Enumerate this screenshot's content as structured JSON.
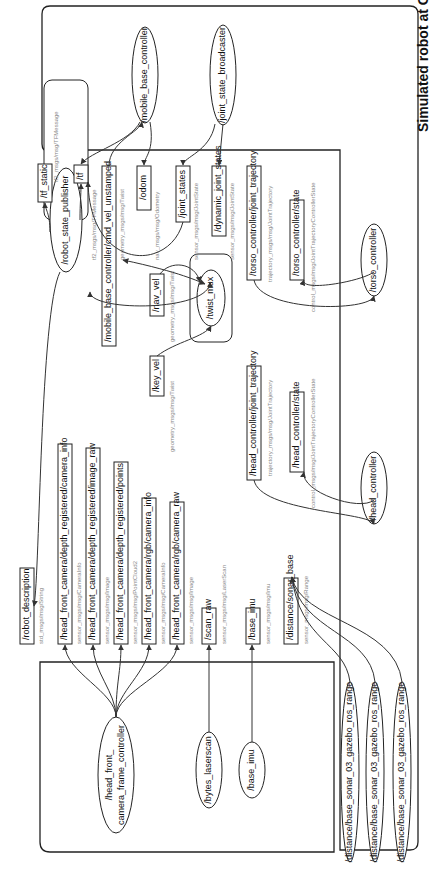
{
  "diagram": {
    "title": "Simulated robot at Gazebo",
    "nodes": {
      "mobile_base_controller": "/mobile_base_controller",
      "joint_state_broadcaster": "/joint_state_broadcaster",
      "robot_state_publisher": "/robot_state_publisher",
      "twist_mux": "/twist_mux",
      "torso_controller": "/torso_controller",
      "head_controller": "/head_controller",
      "head_front_camera_line1": "/head_front_",
      "head_front_camera_line2": "camera_frame_controller",
      "bytes_laserscan": "/bytes_laserscan",
      "base_imu_node": "/base_imu",
      "sonar_1": "/distance/base_sonar_03_gazebo_ros_range",
      "sonar_2": "/distance/base_sonar_03_gazebo_ros_range",
      "sonar_3": "/distance/base_sonar_03_gazebo_ros_range"
    },
    "topics": [
      {
        "name": "/tf_static",
        "type": "tf2_msgs/msg/TFMessage"
      },
      {
        "name": "/tf",
        "type": "tf2_msgs/msg/TFMessage"
      },
      {
        "name": "/mobile_base_controller/cmd_vel_unstamped",
        "type": "geometry_msgs/msg/Twist"
      },
      {
        "name": "/odom",
        "type": "nav_msgs/msg/Odometry"
      },
      {
        "name": "/joint_states",
        "type": "sensor_msgs/msg/JointState"
      },
      {
        "name": "/dynamic_joint_states",
        "type": "sensor_msgs/msg/JointState"
      },
      {
        "name": "/torso_controller/joint_trajectory",
        "type": "trajectory_msgs/msg/JointTrajectory"
      },
      {
        "name": "/torso_controller/state",
        "type": "control_msgs/msg/JointTrajectoryControllerState"
      },
      {
        "name": "/nav_vel",
        "type": "geometry_msgs/msg/Twist"
      },
      {
        "name": "/key_vel",
        "type": "geometry_msgs/msg/Twist"
      },
      {
        "name": "/head_controller/joint_trajectory",
        "type": "trajectory_msgs/msg/JointTrajectory"
      },
      {
        "name": "/head_controller/state",
        "type": "control_msgs/msg/JointTrajectoryControllerState"
      },
      {
        "name": "/robot_description",
        "type": "std_msgs/msg/String"
      },
      {
        "name": "/head_front_camera/depth_registered/camera_info",
        "type": "sensor_msgs/msg/CameraInfo"
      },
      {
        "name": "/head_front_camera/depth_registered/image_raw",
        "type": "sensor_msgs/msg/Image"
      },
      {
        "name": "/head_front_camera/depth_registered/points",
        "type": "sensor_msgs/msg/PointCloud2"
      },
      {
        "name": "/head_front_camera/rgb/camera_info",
        "type": "sensor_msgs/msg/CameraInfo"
      },
      {
        "name": "/head_front_camera/rgb/camera_raw",
        "type": "sensor_msgs/msg/Image"
      },
      {
        "name": "/scan_raw",
        "type": "sensor_msgs/msg/LaserScan"
      },
      {
        "name": "/base_imu",
        "type": "sensor_msgs/msg/Imu"
      },
      {
        "name": "/distance/sonar_base",
        "type": "sensor_msgs/msg/Range"
      }
    ]
  }
}
